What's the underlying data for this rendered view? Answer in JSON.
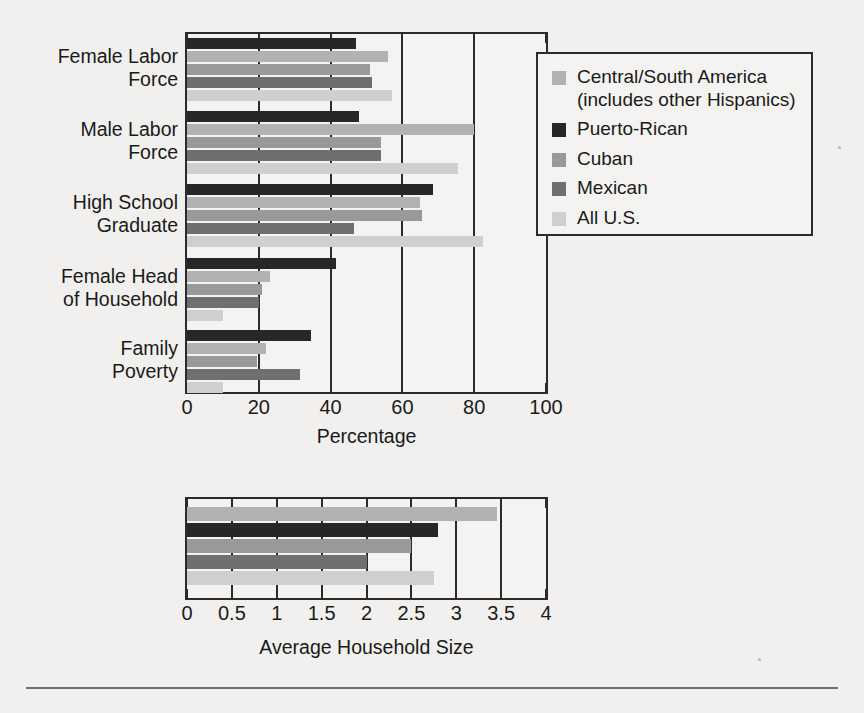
{
  "chart_data": [
    {
      "type": "bar",
      "orientation": "horizontal",
      "title": "",
      "xlabel": "Percentage",
      "ylabel": "",
      "xlim": [
        0,
        100
      ],
      "xticks": [
        "0",
        "20",
        "40",
        "60",
        "80",
        "100"
      ],
      "xtick_values": [
        0,
        20,
        40,
        60,
        80,
        100
      ],
      "grid": true,
      "legend_position": "upper-right",
      "categories": [
        "Female Labor Force",
        "Male Labor Force",
        "High School Graduate",
        "Female Head of Household",
        "Family Poverty"
      ],
      "category_lines": [
        [
          "Female Labor",
          "Force"
        ],
        [
          "Male Labor",
          "Force"
        ],
        [
          "High School",
          "Graduate"
        ],
        [
          "Female Head",
          "of Household"
        ],
        [
          "Family",
          "Poverty"
        ]
      ],
      "series": [
        {
          "name": "Puerto-Rican",
          "color": "#272727",
          "values": [
            47,
            48,
            68.5,
            41.5,
            34.5
          ]
        },
        {
          "name": "Central/South America (includes other Hispanics)",
          "color": "#b2b2b2",
          "values": [
            56,
            80,
            65,
            23,
            22
          ]
        },
        {
          "name": "Cuban",
          "color": "#999999",
          "values": [
            51,
            54,
            65.5,
            21,
            19.5
          ]
        },
        {
          "name": "Mexican",
          "color": "#6f6f6f",
          "values": [
            51.5,
            54,
            46.5,
            20,
            31.5
          ]
        },
        {
          "name": "All U.S.",
          "color": "#cfcfcf",
          "values": [
            57,
            75.5,
            82.5,
            10,
            10
          ]
        }
      ]
    },
    {
      "type": "bar",
      "orientation": "horizontal",
      "title": "",
      "xlabel": "Average Household Size",
      "ylabel": "",
      "xlim": [
        0,
        4
      ],
      "xticks": [
        "0",
        "0.5",
        "1",
        "1.5",
        "2",
        "2.5",
        "3",
        "3.5",
        "4"
      ],
      "xtick_values": [
        0,
        0.5,
        1,
        1.5,
        2,
        2.5,
        3,
        3.5,
        4
      ],
      "grid": true,
      "categories": [
        ""
      ],
      "series": [
        {
          "name": "Central/South America (includes other Hispanics)",
          "color": "#b2b2b2",
          "values": [
            3.45
          ]
        },
        {
          "name": "Puerto-Rican",
          "color": "#272727",
          "values": [
            2.8
          ]
        },
        {
          "name": "Cuban",
          "color": "#999999",
          "values": [
            2.5
          ]
        },
        {
          "name": "Mexican",
          "color": "#6f6f6f",
          "values": [
            2.0
          ]
        },
        {
          "name": "All U.S.",
          "color": "#cfcfcf",
          "values": [
            2.75
          ]
        }
      ]
    }
  ],
  "legend": {
    "entries": [
      {
        "label_line1": "Central/South America",
        "label_line2": "(includes other Hispanics)",
        "color": "#b2b2b2"
      },
      {
        "label_line1": "Puerto-Rican",
        "label_line2": "",
        "color": "#272727"
      },
      {
        "label_line1": "Cuban",
        "label_line2": "",
        "color": "#999999"
      },
      {
        "label_line1": "Mexican",
        "label_line2": "",
        "color": "#6f6f6f"
      },
      {
        "label_line1": "All U.S.",
        "label_line2": "",
        "color": "#cfcfcf"
      }
    ]
  },
  "top_chart": {
    "axis_title": "Percentage"
  },
  "bottom_chart": {
    "axis_title": "Average Household Size"
  },
  "colors": {
    "frame": "#2b2b2b",
    "background": "#f1f0ee",
    "plot_background": "#f4f3f1",
    "text": "#1a1a1a",
    "footer_rule": "#6f6f6f"
  }
}
